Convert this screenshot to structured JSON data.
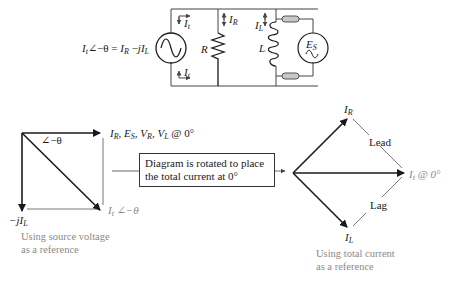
{
  "circuit": {
    "equation": {
      "lhs": "I",
      "lhs_sub": "t",
      "angle": "∠−θ = ",
      "r": "I",
      "r_sub": "R",
      "minus": " −",
      "j": "jI",
      "j_sub": "L"
    },
    "labels": {
      "it_top": {
        "main": "I",
        "sub": "t"
      },
      "it_bottom": {
        "main": "I",
        "sub": "t"
      },
      "ir": {
        "main": "I",
        "sub": "R"
      },
      "il": {
        "main": "I",
        "sub": "L"
      },
      "resistor": "R",
      "inductor": "L",
      "es": {
        "main": "E",
        "sub": "S"
      }
    }
  },
  "left_phasor": {
    "label_top": {
      "parts": [
        "I",
        "R",
        ", E",
        "S",
        ", V",
        "R",
        ", V",
        "L",
        " @ 0°"
      ]
    },
    "angle_label": "∠−θ",
    "label_bottom_left": {
      "main": "−jI",
      "sub": "L"
    },
    "label_diag": {
      "main": "I",
      "sub": "t",
      "suffix": " ∠−θ"
    },
    "caption": [
      "Using source voltage",
      "as a reference"
    ]
  },
  "note_box": {
    "lines": [
      "Diagram is rotated to place",
      "the total current at 0°"
    ]
  },
  "right_phasor": {
    "label_up": {
      "main": "I",
      "sub": "R"
    },
    "label_down": {
      "main": "I",
      "sub": "L"
    },
    "label_right": {
      "main": "I",
      "sub": "t",
      "suffix": " @ 0°"
    },
    "lead": "Lead",
    "lag": "Lag",
    "caption": [
      "Using total current",
      "as a reference"
    ]
  },
  "colors": {
    "line": "#1a1a1a",
    "thin": "#444444",
    "caption": "#8a8a8a",
    "terminal": "#b5b5b5"
  }
}
